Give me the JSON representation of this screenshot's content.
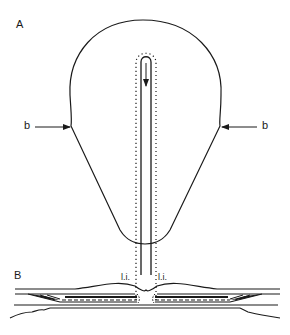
{
  "figure": {
    "panel_a_label": "A",
    "panel_b_label": "B",
    "arrow_label_left": "b",
    "arrow_label_right": "b",
    "li_label_left": "l.i.",
    "li_label_right": "l.i."
  },
  "colors": {
    "ink": "#1a1a1a",
    "background": "#ffffff"
  }
}
